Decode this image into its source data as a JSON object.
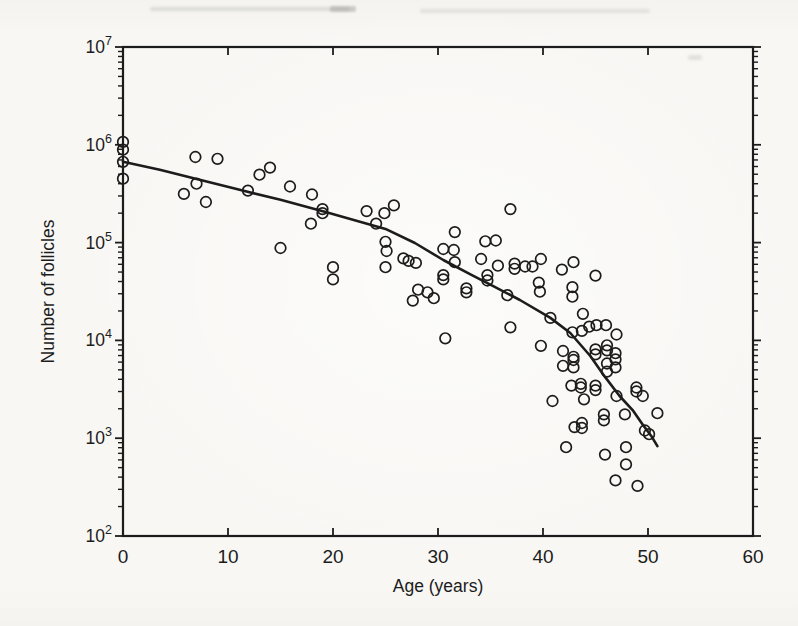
{
  "figure": {
    "ink_color": "#1c1c1c",
    "background_color": "#f7f6f3"
  },
  "chart_data": {
    "type": "scatter",
    "title": "",
    "xlabel": "Age (years)",
    "ylabel": "Number of follicles",
    "grid": false,
    "legend": "none",
    "x_axis": {
      "min": 0,
      "max": 60,
      "tick_labels": [
        "0",
        "10",
        "20",
        "30",
        "40",
        "50",
        "60"
      ],
      "tick_values": [
        0,
        10,
        20,
        30,
        40,
        50,
        60
      ]
    },
    "y_axis": {
      "scale": "log",
      "min": 100,
      "max": 10000000,
      "tick_base": "10",
      "tick_exponents": [
        7,
        6,
        5,
        4,
        3,
        2
      ],
      "minor_ticks": [
        2,
        3,
        4,
        5,
        6,
        7,
        8,
        9
      ]
    },
    "series": [
      {
        "name": "observed follicle counts",
        "marker": "open-circle",
        "points": [
          [
            0.0,
            1070000
          ],
          [
            0.0,
            890000
          ],
          [
            0.0,
            670000
          ],
          [
            0.0,
            450000
          ],
          [
            5.8,
            315000
          ],
          [
            6.9,
            750000
          ],
          [
            7.0,
            400000
          ],
          [
            7.9,
            260000
          ],
          [
            9.0,
            720000
          ],
          [
            11.9,
            340000
          ],
          [
            13.0,
            495000
          ],
          [
            14.0,
            585000
          ],
          [
            15.0,
            88000
          ],
          [
            15.9,
            375000
          ],
          [
            18.0,
            310000
          ],
          [
            17.9,
            156000
          ],
          [
            19.0,
            220000
          ],
          [
            19.0,
            200000
          ],
          [
            20.0,
            56000
          ],
          [
            20.0,
            42000
          ],
          [
            23.2,
            210000
          ],
          [
            24.1,
            156000
          ],
          [
            24.9,
            200000
          ],
          [
            25.8,
            240000
          ],
          [
            25.0,
            102000
          ],
          [
            25.1,
            82000
          ],
          [
            25.0,
            56000
          ],
          [
            26.7,
            69000
          ],
          [
            27.2,
            65000
          ],
          [
            27.9,
            62000
          ],
          [
            27.6,
            25500
          ],
          [
            28.1,
            33000
          ],
          [
            29.0,
            31000
          ],
          [
            29.6,
            27000
          ],
          [
            30.5,
            86000
          ],
          [
            31.5,
            84000
          ],
          [
            31.6,
            128000
          ],
          [
            31.6,
            63000
          ],
          [
            30.5,
            46500
          ],
          [
            30.5,
            42000
          ],
          [
            30.7,
            10500
          ],
          [
            32.7,
            34000
          ],
          [
            32.7,
            31000
          ],
          [
            34.1,
            68000
          ],
          [
            34.5,
            103000
          ],
          [
            35.5,
            105000
          ],
          [
            34.7,
            46500
          ],
          [
            34.7,
            41000
          ],
          [
            35.7,
            58000
          ],
          [
            36.6,
            29000
          ],
          [
            36.9,
            220000
          ],
          [
            36.9,
            13600
          ],
          [
            37.3,
            61000
          ],
          [
            37.3,
            54000
          ],
          [
            38.3,
            57000
          ],
          [
            39.0,
            57000
          ],
          [
            39.8,
            68000
          ],
          [
            39.6,
            39000
          ],
          [
            39.7,
            31500
          ],
          [
            39.8,
            8800
          ],
          [
            40.7,
            17000
          ],
          [
            40.9,
            2400
          ],
          [
            41.8,
            53000
          ],
          [
            41.9,
            7800
          ],
          [
            41.9,
            5500
          ],
          [
            42.2,
            810
          ],
          [
            42.7,
            3450
          ],
          [
            42.9,
            63000
          ],
          [
            42.8,
            35000
          ],
          [
            42.8,
            28000
          ],
          [
            42.8,
            12100
          ],
          [
            42.9,
            6800
          ],
          [
            42.9,
            6300
          ],
          [
            42.9,
            5300
          ],
          [
            43.0,
            1300
          ],
          [
            43.6,
            3600
          ],
          [
            43.6,
            3300
          ],
          [
            43.7,
            1430
          ],
          [
            43.7,
            1270
          ],
          [
            43.9,
            2500
          ],
          [
            43.8,
            18700
          ],
          [
            43.7,
            12500
          ],
          [
            44.4,
            13800
          ],
          [
            45.1,
            14300
          ],
          [
            46.0,
            14300
          ],
          [
            47.0,
            11500
          ],
          [
            45.0,
            46000
          ],
          [
            45.0,
            8100
          ],
          [
            45.0,
            7200
          ],
          [
            46.1,
            8900
          ],
          [
            46.1,
            7900
          ],
          [
            46.9,
            7400
          ],
          [
            46.9,
            6400
          ],
          [
            46.1,
            5800
          ],
          [
            46.9,
            5300
          ],
          [
            46.1,
            4800
          ],
          [
            45.0,
            3450
          ],
          [
            45.0,
            3100
          ],
          [
            45.8,
            1750
          ],
          [
            45.8,
            1520
          ],
          [
            45.9,
            680
          ],
          [
            46.9,
            370
          ],
          [
            47.0,
            2700
          ],
          [
            47.8,
            1750
          ],
          [
            47.9,
            810
          ],
          [
            47.9,
            540
          ],
          [
            48.9,
            3300
          ],
          [
            48.9,
            3000
          ],
          [
            49.5,
            2700
          ],
          [
            49.0,
            325
          ],
          [
            49.7,
            1200
          ],
          [
            50.1,
            1100
          ],
          [
            50.9,
            1800
          ]
        ]
      }
    ],
    "fit_curve": {
      "name": "model fit",
      "points": [
        [
          0.0,
          670000
        ],
        [
          3.5,
          557000
        ],
        [
          7.3,
          440000
        ],
        [
          11.1,
          347000
        ],
        [
          15.0,
          274000
        ],
        [
          19.3,
          206000
        ],
        [
          25.0,
          138000
        ],
        [
          27.8,
          99000
        ],
        [
          30.5,
          66400
        ],
        [
          33.0,
          47900
        ],
        [
          35.4,
          35200
        ],
        [
          37.8,
          25900
        ],
        [
          40.7,
          17000
        ],
        [
          42.6,
          11900
        ],
        [
          44.5,
          6930
        ],
        [
          45.9,
          4230
        ],
        [
          47.3,
          2700
        ],
        [
          48.6,
          1900
        ],
        [
          49.5,
          1370
        ],
        [
          50.3,
          1060
        ],
        [
          50.9,
          830
        ]
      ]
    },
    "layout": {
      "plot_left_px": 123,
      "plot_top_px": 47,
      "plot_right_px": 753,
      "plot_bottom_px": 536,
      "marker_radius_px": 5.3,
      "marker_stroke_px": 1.7,
      "curve_width_px": 2.6,
      "frame_width_px": 2.2
    }
  }
}
